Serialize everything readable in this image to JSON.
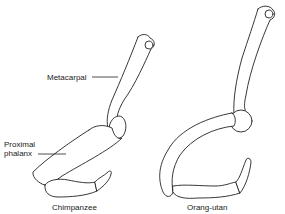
{
  "figure": {
    "specimens": [
      {
        "name": "Chimpanzee"
      },
      {
        "name": "Orang-utan"
      }
    ],
    "labels": {
      "metacarpal": "Metacarpal",
      "proximal_phalanx_line1": "Proximal",
      "proximal_phalanx_line2": "phalanx"
    },
    "colors": {
      "stroke": "#222222",
      "background": "#ffffff"
    }
  }
}
